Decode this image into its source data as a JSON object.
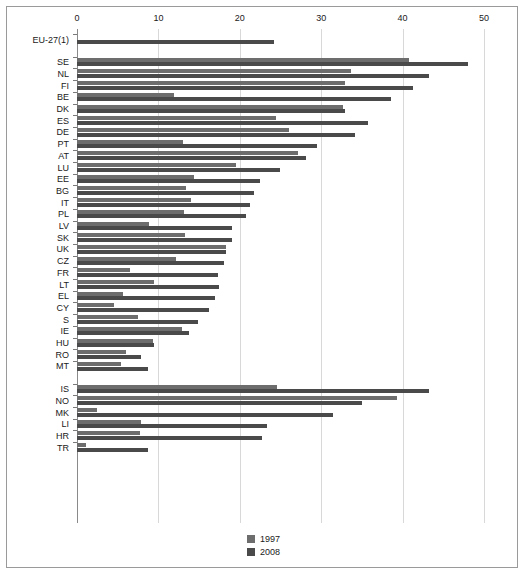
{
  "chart_data": {
    "type": "bar",
    "orientation": "horizontal",
    "title": "",
    "xlabel": "",
    "ylabel": "",
    "xlim": [
      0,
      50
    ],
    "xticks": [
      0,
      10,
      20,
      30,
      40,
      50
    ],
    "grid": true,
    "legend_position": "bottom-center",
    "series": [
      {
        "name": "1997",
        "color": "#6d6d6d"
      },
      {
        "name": "2008",
        "color": "#4a4a4a"
      }
    ],
    "groups": [
      {
        "name": "aggregate",
        "categories": [
          "EU-27(1)"
        ],
        "rows": [
          {
            "label": "EU-27(1)",
            "v1997": null,
            "v2008": 24.2
          }
        ]
      },
      {
        "name": "eu-members",
        "categories": [
          "SE",
          "NL",
          "FI",
          "BE",
          "DK",
          "ES",
          "DE",
          "PT",
          "AT",
          "LU",
          "EE",
          "BG",
          "IT",
          "PL",
          "LV",
          "SK",
          "UK",
          "CZ",
          "FR",
          "LT",
          "EL",
          "CY",
          "S",
          "IE",
          "HU",
          "RO",
          "MT"
        ],
        "rows": [
          {
            "label": "SE",
            "v1997": 40.8,
            "v2008": 48.0
          },
          {
            "label": "NL",
            "v1997": 33.6,
            "v2008": 43.2
          },
          {
            "label": "FI",
            "v1997": 32.9,
            "v2008": 41.3
          },
          {
            "label": "BE",
            "v1997": 11.9,
            "v2008": 38.6
          },
          {
            "label": "DK",
            "v1997": 32.7,
            "v2008": 32.9
          },
          {
            "label": "ES",
            "v1997": 24.5,
            "v2008": 35.8
          },
          {
            "label": "DE",
            "v1997": 26.1,
            "v2008": 34.1
          },
          {
            "label": "PT",
            "v1997": 13.0,
            "v2008": 29.5
          },
          {
            "label": "AT",
            "v1997": 27.2,
            "v2008": 28.1
          },
          {
            "label": "LU",
            "v1997": 19.5,
            "v2008": 24.9
          },
          {
            "label": "EE",
            "v1997": 14.4,
            "v2008": 22.5
          },
          {
            "label": "BG",
            "v1997": 13.4,
            "v2008": 21.8
          },
          {
            "label": "IT",
            "v1997": 14.0,
            "v2008": 21.2
          },
          {
            "label": "PL",
            "v1997": 13.1,
            "v2008": 20.8
          },
          {
            "label": "LV",
            "v1997": 8.8,
            "v2008": 19.1
          },
          {
            "label": "SK",
            "v1997": 13.3,
            "v2008": 19.0
          },
          {
            "label": "UK",
            "v1997": 18.3,
            "v2008": 18.3
          },
          {
            "label": "CZ",
            "v1997": 12.2,
            "v2008": 18.1
          },
          {
            "label": "FR",
            "v1997": 6.5,
            "v2008": 17.3
          },
          {
            "label": "LT",
            "v1997": 9.5,
            "v2008": 17.5
          },
          {
            "label": "EL",
            "v1997": 5.6,
            "v2008": 16.9
          },
          {
            "label": "CY",
            "v1997": 4.6,
            "v2008": 16.2
          },
          {
            "label": "S",
            "v1997": 7.5,
            "v2008": 14.9
          },
          {
            "label": "IE",
            "v1997": 12.9,
            "v2008": 13.8
          },
          {
            "label": "HU",
            "v1997": 9.3,
            "v2008": 9.4
          },
          {
            "label": "RO",
            "v1997": 6.0,
            "v2008": 7.9
          },
          {
            "label": "MT",
            "v1997": 5.4,
            "v2008": 8.7
          }
        ]
      },
      {
        "name": "non-eu",
        "categories": [
          "IS",
          "NO",
          "MK",
          "LI",
          "HR",
          "TR"
        ],
        "rows": [
          {
            "label": "IS",
            "v1997": 24.6,
            "v2008": 43.2
          },
          {
            "label": "NO",
            "v1997": 39.3,
            "v2008": 35.0
          },
          {
            "label": "MK",
            "v1997": 2.4,
            "v2008": 31.5
          },
          {
            "label": "LI",
            "v1997": 7.9,
            "v2008": 23.4
          },
          {
            "label": "HR",
            "v1997": 7.8,
            "v2008": 22.7
          },
          {
            "label": "TR",
            "v1997": 1.1,
            "v2008": 8.7
          }
        ]
      }
    ],
    "legend": [
      {
        "label": "1997",
        "color": "#6d6d6d"
      },
      {
        "label": "2008",
        "color": "#4a4a4a"
      }
    ]
  },
  "axis": {
    "ticks": [
      "0",
      "10",
      "20",
      "30",
      "40",
      "50"
    ]
  }
}
